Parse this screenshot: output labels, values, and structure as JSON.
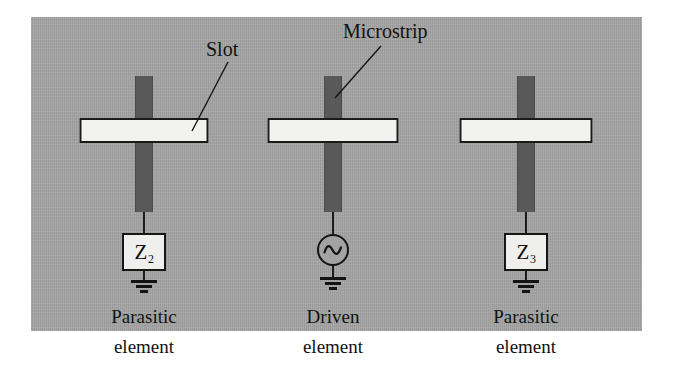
{
  "figure": {
    "type": "antenna-array-schematic",
    "background_color": "#a3a3a3",
    "strip_color": "#595959",
    "slot_fill_color": "#f2f2f0",
    "line_color": "#141414"
  },
  "annotations": [
    {
      "id": "slot",
      "label": "Slot"
    },
    {
      "id": "microstrip",
      "label": "Microstrip"
    }
  ],
  "elements": [
    {
      "id": "left",
      "role": "parasitic",
      "termination_type": "impedance",
      "impedance_label": "Z",
      "impedance_subscript": "2",
      "caption_line1": "Parasitic",
      "caption_line2": "element"
    },
    {
      "id": "middle",
      "role": "driven",
      "termination_type": "source",
      "source_symbol": "ac-source-icon",
      "caption_line1": "Driven",
      "caption_line2": "element"
    },
    {
      "id": "right",
      "role": "parasitic",
      "termination_type": "impedance",
      "impedance_label": "Z",
      "impedance_subscript": "3",
      "caption_line1": "Parasitic",
      "caption_line2": "element"
    }
  ]
}
